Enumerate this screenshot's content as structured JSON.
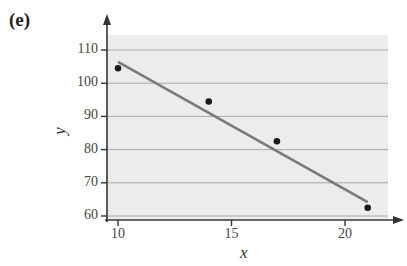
{
  "panel_label": "(e)",
  "chart_data": {
    "type": "scatter",
    "title": "",
    "xlabel": "x",
    "ylabel": "y",
    "xlim": [
      9.5,
      22.5
    ],
    "ylim": [
      59,
      115
    ],
    "x_ticks": [
      10,
      15,
      20
    ],
    "y_ticks": [
      60,
      70,
      80,
      90,
      100,
      110
    ],
    "grid": "horizontal",
    "points": [
      {
        "x": 10,
        "y": 104.5
      },
      {
        "x": 14,
        "y": 94.5
      },
      {
        "x": 17,
        "y": 82.5
      },
      {
        "x": 21,
        "y": 62.5
      }
    ],
    "trendline": {
      "type": "linear",
      "start": {
        "x": 10,
        "y": 106.4
      },
      "end": {
        "x": 21,
        "y": 64.2
      }
    },
    "colors": {
      "plot_background": "#ececec",
      "gridline": "#a8a8a8",
      "trendline": "#7a7a7a",
      "point": "#1a1a1a",
      "axis": "#333333"
    }
  }
}
